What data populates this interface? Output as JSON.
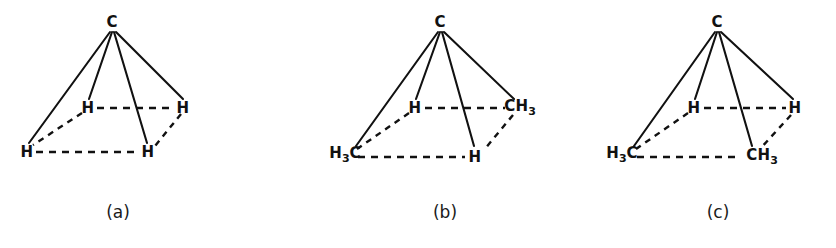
{
  "figure": {
    "background_color": "#ffffff",
    "line_color": "#111111",
    "panels": [
      {
        "caption": "(a)",
        "caption_pos": {
          "x": 118,
          "y": 212
        },
        "apex": {
          "label": "C",
          "x": 112,
          "y": 22
        },
        "vertices": [
          {
            "name": "back-left",
            "label": "H",
            "sub": "",
            "x": 88,
            "y": 108
          },
          {
            "name": "back-right",
            "label": "H",
            "sub": "",
            "x": 183,
            "y": 108
          },
          {
            "name": "front-left",
            "label": "H",
            "sub": "",
            "x": 27,
            "y": 152
          },
          {
            "name": "front-right",
            "label": "H",
            "sub": "",
            "x": 148,
            "y": 152
          }
        ]
      },
      {
        "caption": "(b)",
        "caption_pos": {
          "x": 445,
          "y": 212
        },
        "apex": {
          "label": "C",
          "x": 440,
          "y": 22
        },
        "vertices": [
          {
            "name": "back-left",
            "label": "H",
            "sub": "",
            "x": 415,
            "y": 108
          },
          {
            "name": "back-right",
            "label": "CH",
            "sub": "3",
            "x": 517,
            "y": 108
          },
          {
            "name": "front-left",
            "label": "H",
            "sub": "3",
            "x": 345,
            "y": 155,
            "prefix": true
          },
          {
            "name": "front-right",
            "label": "H",
            "sub": "",
            "x": 475,
            "y": 155
          }
        ]
      },
      {
        "caption": "(c)",
        "caption_pos": {
          "x": 718,
          "y": 212
        },
        "apex": {
          "label": "C",
          "x": 717,
          "y": 22
        },
        "vertices": [
          {
            "name": "back-left",
            "label": "H",
            "sub": "",
            "x": 694,
            "y": 108
          },
          {
            "name": "back-right",
            "label": "H",
            "sub": "",
            "x": 795,
            "y": 108
          },
          {
            "name": "front-left",
            "label": "H",
            "sub": "3",
            "x": 622,
            "y": 155,
            "prefix": true
          },
          {
            "name": "front-right",
            "label": "CH",
            "sub": "3",
            "x": 760,
            "y": 155
          }
        ]
      }
    ],
    "labels": {
      "a": {
        "caption": "(a)",
        "apex": "C",
        "back_left": "H",
        "back_right": "H",
        "front_left": "H",
        "front_right": "H"
      },
      "b": {
        "caption": "(b)",
        "apex": "C",
        "back_left": "H",
        "back_right_main": "CH",
        "back_right_sub": "3",
        "front_left_main": "H",
        "front_left_sub": "3",
        "front_left_tail": "C",
        "front_right": "H"
      },
      "c": {
        "caption": "(c)",
        "apex": "C",
        "back_left": "H",
        "back_right": "H",
        "front_left_main": "H",
        "front_left_sub": "3",
        "front_left_tail": "C",
        "front_right_main": "CH",
        "front_right_sub": "3"
      }
    }
  }
}
